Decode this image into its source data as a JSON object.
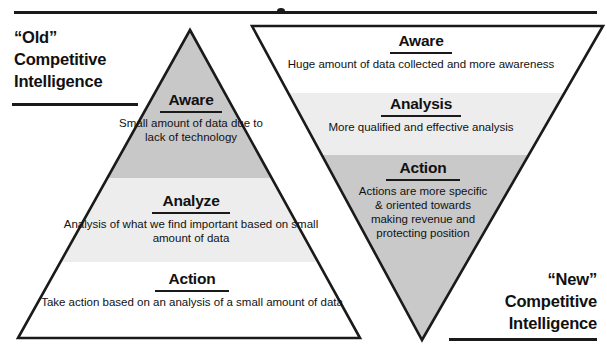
{
  "diagram": {
    "top_rule_present": true,
    "captions": {
      "old": {
        "line1": "“Old”",
        "line2": "Competitive",
        "line3": "Intelligence"
      },
      "new": {
        "line1": "“New”",
        "line2": "Competitive",
        "line3": "Intelligence"
      }
    },
    "old_pyramid": {
      "shape": "triangle-upright",
      "tiers": [
        {
          "title": "Aware",
          "body": "Small amount of data due to lack of technology",
          "fill": "#c8c8c8"
        },
        {
          "title": "Analyze",
          "body": "Analysis of what we find important based on small amount of data",
          "fill": "#ededed"
        },
        {
          "title": "Action",
          "body": "Take action based on an analysis of a small amount of data",
          "fill": "#ffffff"
        }
      ]
    },
    "new_pyramid": {
      "shape": "triangle-inverted",
      "tiers": [
        {
          "title": "Aware",
          "body": "Huge amount of data collected and more awareness",
          "fill": "#ffffff"
        },
        {
          "title": "Analysis",
          "body": "More qualified and effective analysis",
          "fill": "#ededed"
        },
        {
          "title": "Action",
          "body": "Actions are more specific & oriented towards making revenue and protecting position",
          "fill": "#c9c9c9"
        }
      ]
    },
    "colors": {
      "outline": "#1a1a1a",
      "band_dark": "#c8c8c8",
      "band_light": "#ededed",
      "band_white": "#ffffff",
      "text": "#111111"
    }
  }
}
